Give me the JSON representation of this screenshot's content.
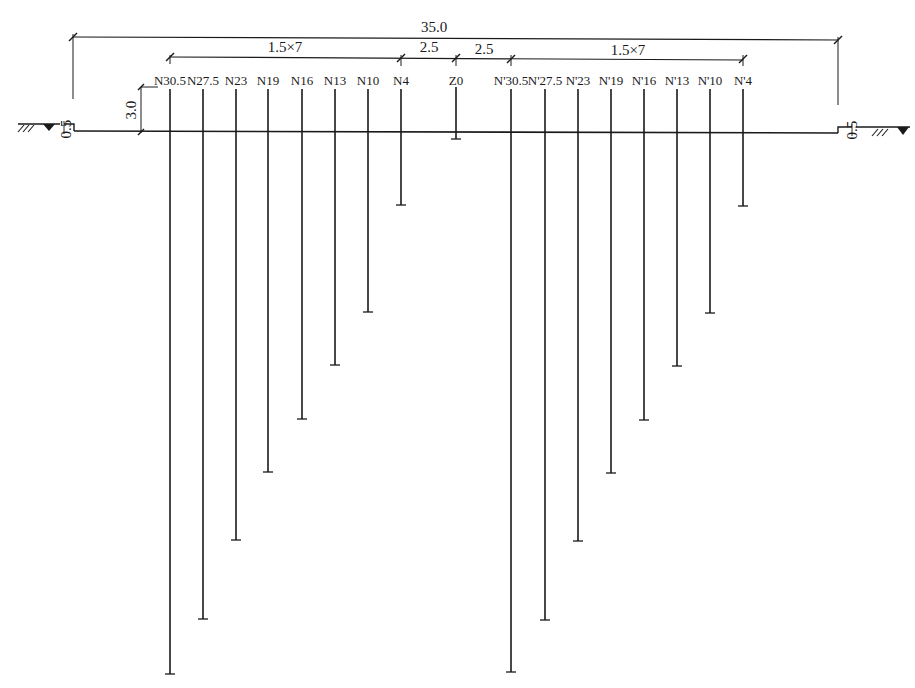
{
  "diagram": {
    "type": "pile-layout-section",
    "ground_y": 131,
    "colors": {
      "line": "#1a1a1a",
      "background": "#ffffff"
    },
    "dimensions": {
      "overall": {
        "label": "35.0",
        "x1": 73,
        "x2": 838,
        "y": 37
      },
      "left_group": {
        "label": "1.5×7",
        "x1": 170,
        "x2": 401,
        "y": 57
      },
      "left_gap": {
        "label": "2.5",
        "x1": 401,
        "x2": 456,
        "y": 57
      },
      "right_gap": {
        "label": "2.5",
        "x1": 456,
        "x2": 511,
        "y": 57
      },
      "right_group": {
        "label": "1.5×7",
        "x1": 511,
        "x2": 743,
        "y": 57
      },
      "height": {
        "label": "3.0"
      },
      "left_step": {
        "label": "0.5"
      },
      "right_step": {
        "label": "0.5"
      }
    },
    "piles": [
      {
        "label": "N30.5",
        "x": 170,
        "bottom": 674
      },
      {
        "label": "N27.5",
        "x": 203,
        "bottom": 619
      },
      {
        "label": "N23",
        "x": 236,
        "bottom": 540
      },
      {
        "label": "N19",
        "x": 268,
        "bottom": 472
      },
      {
        "label": "N16",
        "x": 302,
        "bottom": 419
      },
      {
        "label": "N13",
        "x": 335,
        "bottom": 365
      },
      {
        "label": "N10",
        "x": 368,
        "bottom": 312
      },
      {
        "label": "N4",
        "x": 401,
        "bottom": 205
      },
      {
        "label": "Z0",
        "x": 456,
        "bottom": 139
      },
      {
        "label": "N'30.5",
        "x": 511,
        "bottom": 672
      },
      {
        "label": "N'27.5",
        "x": 545,
        "bottom": 620
      },
      {
        "label": "N'23",
        "x": 578,
        "bottom": 541
      },
      {
        "label": "N'19",
        "x": 611,
        "bottom": 473
      },
      {
        "label": "N'16",
        "x": 644,
        "bottom": 420
      },
      {
        "label": "N'13",
        "x": 677,
        "bottom": 366
      },
      {
        "label": "N'10",
        "x": 710,
        "bottom": 313
      },
      {
        "label": "N'4",
        "x": 743,
        "bottom": 206
      }
    ]
  }
}
